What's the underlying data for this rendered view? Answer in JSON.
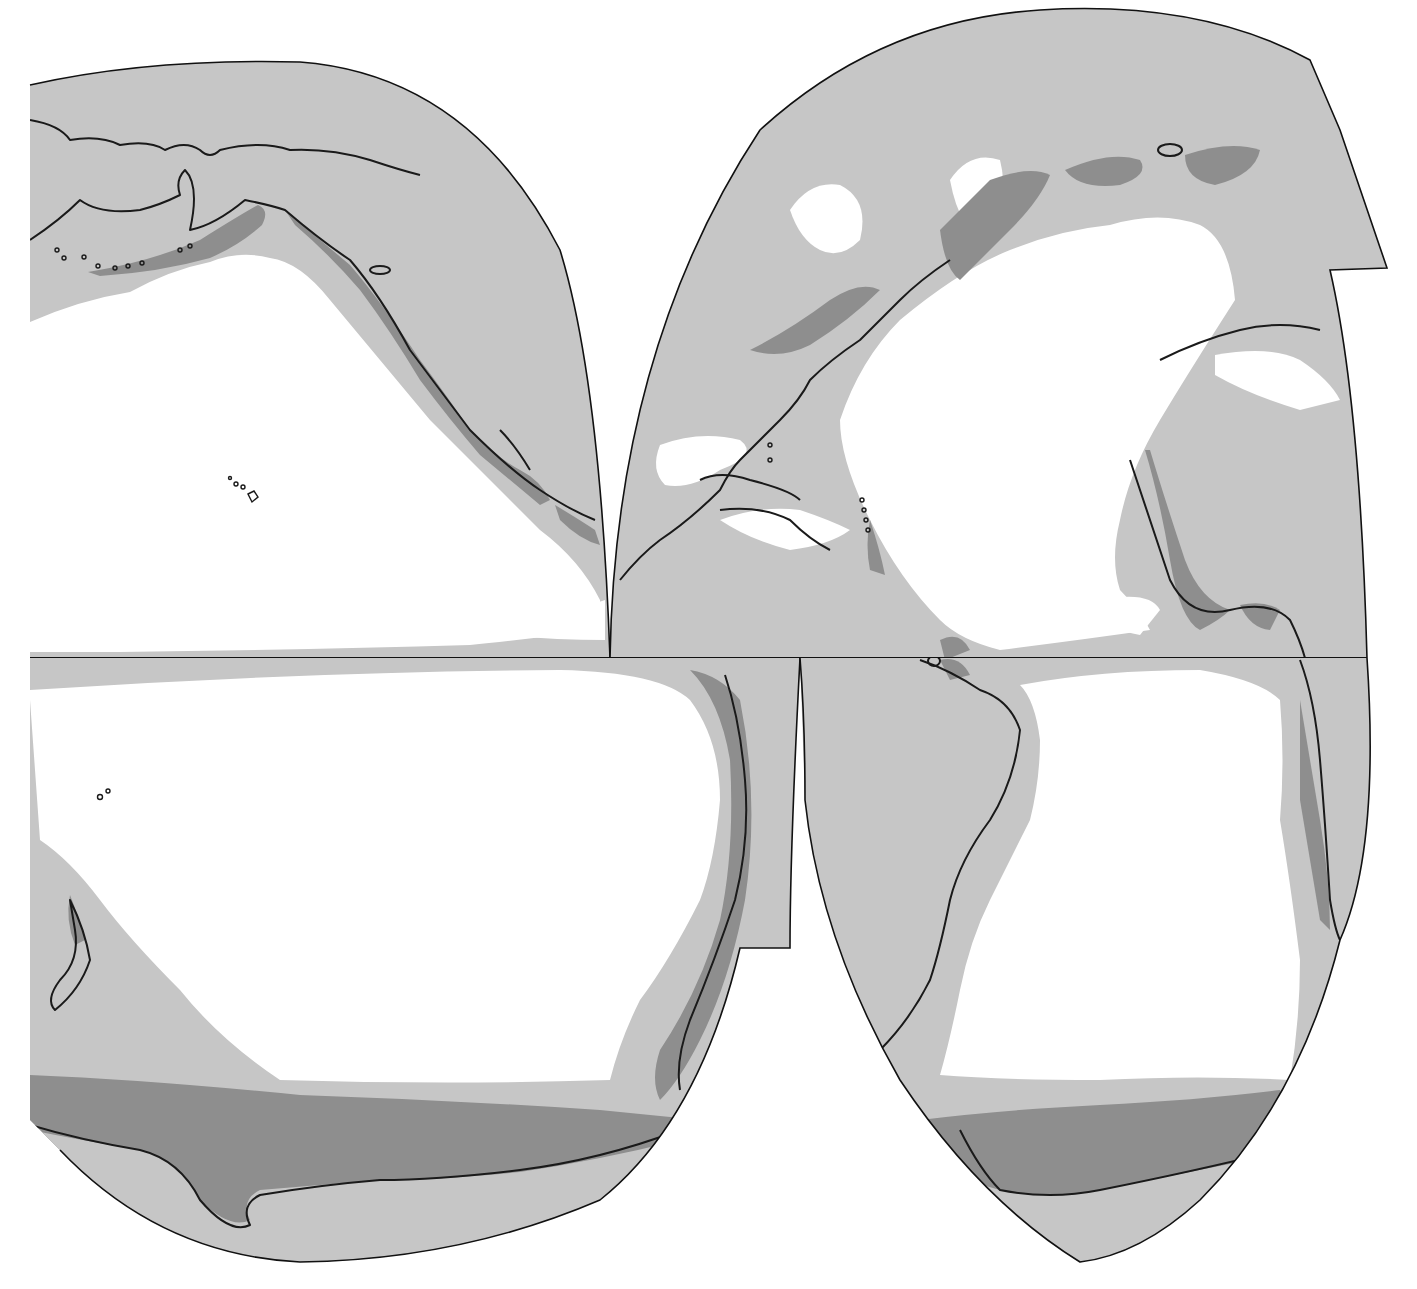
{
  "map": {
    "projection": "interrupted world map (Pacific and Atlantic lobes)",
    "colors": {
      "light_zone": "#c6c6c6",
      "dark_zone": "#8e8e8e",
      "ocean_unshaded": "#ffffff",
      "coastline": "#1a1a1a"
    },
    "lobes": [
      "north-pacific",
      "north-atlantic",
      "south-pacific",
      "south-atlantic"
    ],
    "text_labels": []
  }
}
